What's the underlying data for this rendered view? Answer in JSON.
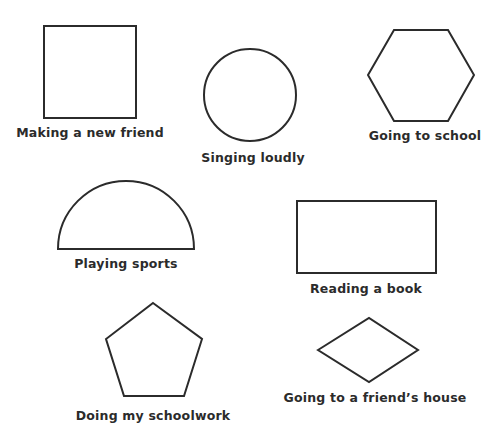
{
  "colors": {
    "stroke": "#2b2b2b",
    "background": "#ffffff",
    "text": "#2b2b2b"
  },
  "items": [
    {
      "shape": "square",
      "label": "Making a new friend"
    },
    {
      "shape": "circle",
      "label": "Singing loudly"
    },
    {
      "shape": "hexagon",
      "label": "Going to school"
    },
    {
      "shape": "semicircle",
      "label": "Playing sports"
    },
    {
      "shape": "rectangle",
      "label": "Reading a book"
    },
    {
      "shape": "pentagon",
      "label": "Doing my schoolwork"
    },
    {
      "shape": "rhombus",
      "label": "Going to a friend’s house"
    }
  ]
}
